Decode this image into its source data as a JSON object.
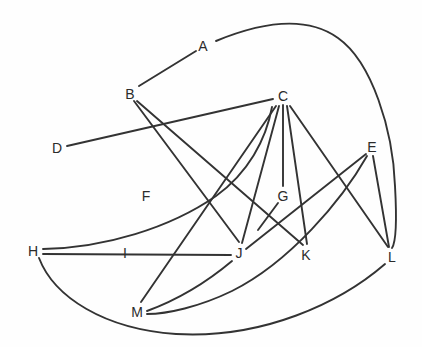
{
  "diagram": {
    "style": {
      "edge_color": "#333333",
      "edge_width": 1.9,
      "label_color": "#2b2b2b",
      "background": "#fefefe",
      "font_size_px": 14
    },
    "nodes": [
      {
        "id": "A",
        "label": "A",
        "x": 203,
        "y": 46
      },
      {
        "id": "B",
        "label": "B",
        "x": 130,
        "y": 94
      },
      {
        "id": "C",
        "label": "C",
        "x": 283,
        "y": 96
      },
      {
        "id": "D",
        "label": "D",
        "x": 57,
        "y": 148
      },
      {
        "id": "E",
        "label": "E",
        "x": 372,
        "y": 147
      },
      {
        "id": "F",
        "label": "F",
        "x": 146,
        "y": 196
      },
      {
        "id": "G",
        "label": "G",
        "x": 283,
        "y": 196
      },
      {
        "id": "H",
        "label": "H",
        "x": 33,
        "y": 251
      },
      {
        "id": "I",
        "label": "I",
        "x": 125,
        "y": 253
      },
      {
        "id": "J",
        "label": "J",
        "x": 239,
        "y": 253
      },
      {
        "id": "K",
        "label": "K",
        "x": 306,
        "y": 255
      },
      {
        "id": "L",
        "label": "L",
        "x": 392,
        "y": 257
      },
      {
        "id": "M",
        "label": "M",
        "x": 137,
        "y": 312
      }
    ],
    "isolated_nodes": [
      "F",
      "I"
    ],
    "edges": [
      {
        "from": "A",
        "to": "B",
        "kind": "line"
      },
      {
        "from": "A",
        "to": "L",
        "kind": "curve"
      },
      {
        "from": "B",
        "to": "J",
        "kind": "line"
      },
      {
        "from": "B",
        "to": "K",
        "kind": "line"
      },
      {
        "from": "C",
        "to": "D",
        "kind": "line"
      },
      {
        "from": "C",
        "to": "G",
        "kind": "line"
      },
      {
        "from": "C",
        "to": "J",
        "kind": "line"
      },
      {
        "from": "C",
        "to": "M",
        "kind": "line"
      },
      {
        "from": "C",
        "to": "K",
        "kind": "line"
      },
      {
        "from": "C",
        "to": "L",
        "kind": "line"
      },
      {
        "from": "E",
        "to": "J",
        "kind": "line"
      },
      {
        "from": "E",
        "to": "L",
        "kind": "line"
      },
      {
        "from": "E",
        "to": "M",
        "kind": "curve"
      },
      {
        "from": "G",
        "to": "K",
        "kind": "line"
      },
      {
        "from": "H",
        "to": "C",
        "kind": "curve"
      },
      {
        "from": "H",
        "to": "J",
        "kind": "line"
      },
      {
        "from": "H",
        "to": "L",
        "kind": "curve"
      },
      {
        "from": "M",
        "to": "J",
        "kind": "curve"
      }
    ],
    "paths": {
      "A_L": "M 216 41 C 262 22 306 15 338 38 C 372 62 393 130 395 186 C 397 222 396 242 392 248",
      "A_B": "M 196 51 L 139 86",
      "B_J": "M 134 101 L 239 242",
      "B_K": "M 137 101 L 303 245",
      "C_D": "M 273 99 L 67 146",
      "C_G": "M 283 105 L 283 186",
      "C_J": "M 279 106 L 242 243",
      "C_M": "M 276 106 L 141 302",
      "C_K": "M 287 106 L 307 244",
      "C_L": "M 290 106 L 388 247",
      "E_J": "M 366 154 L 246 249",
      "E_L": "M 373 156 L 389 247",
      "E_M": "M 367 156 C 342 200 290 262 232 291 C 199 307 167 314 147 314",
      "G_K": "M 278 203 L 258 230",
      "H_C": "M 43 249 C 104 248 170 228 216 196 C 248 173 266 140 272 107",
      "H_J": "M 43 254 L 231 255",
      "H_L": "M 39 258 C 54 297 104 329 176 334 C 263 339 340 303 385 264",
      "M_J": "M 147 311 C 177 300 207 282 232 261"
    }
  }
}
